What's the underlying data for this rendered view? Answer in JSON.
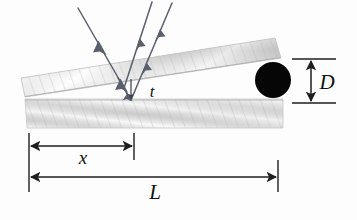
{
  "figure": {
    "background_color": "#fdfdfd",
    "labels": {
      "thickness": "t",
      "distance_x": "x",
      "length_L": "L",
      "diameter_D": "D"
    },
    "colors": {
      "ink": "#101010",
      "ray": "#5a5f6b",
      "plate_light": "#fbfbfb",
      "plate_mid": "#d0d0d0",
      "plate_dark": "#9a9a9a",
      "spacer": "#060606",
      "dimension_line": "#2a2a2a"
    },
    "elements": {
      "top_plate": "upper-glass-plate",
      "bottom_plate": "lower-glass-plate",
      "spacer": "cylindrical-wire-spacer",
      "incident_ray": "incident-light-ray",
      "reflected_ray_top": "reflected-ray-from-top-surface",
      "reflected_ray_bottom": "reflected-ray-from-bottom-surface",
      "transmitted_ray": "transmitted-ray-through-film"
    },
    "geometry": {
      "top_plate_points": "21,78 275,38 281,58 25,97",
      "bottom_plate_points": "25,99 283,99 283,128 27,128",
      "spacer_cx": 273,
      "spacer_cy": 80,
      "spacer_r": 18,
      "x_dim_left": 29,
      "x_dim_right": 134,
      "x_dim_y": 146,
      "L_dim_left": 29,
      "L_dim_right": 278,
      "L_dim_y": 178,
      "D_dim_x": 311,
      "D_dim_top": 59,
      "D_dim_bottom": 103,
      "t_arrow_x": 131,
      "t_arrow_top": 79,
      "t_arrow_bottom": 100
    }
  }
}
